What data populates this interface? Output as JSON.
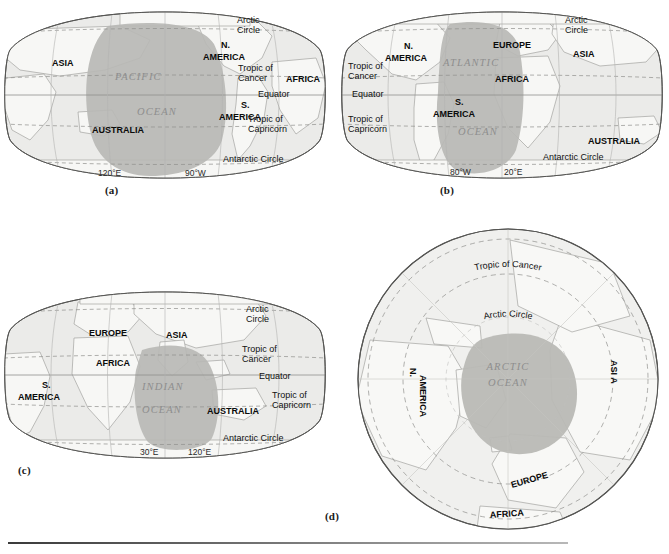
{
  "figure": {
    "panel_count": 4,
    "background_color": "#ffffff",
    "rule_color": "#3a3a3a"
  },
  "colors": {
    "land_fill": "#f2f2f0",
    "land_stroke": "#9a9a96",
    "ocean_fill": "#ebebe9",
    "highlight_ocean_fill": "#b9b9b5",
    "globe_stroke": "#555553",
    "latitude_line": "#8f8f8d",
    "ocean_label": "#8e8e8e",
    "text": "#0b0b0b"
  },
  "panels": [
    {
      "id": "a",
      "caption": "(a)",
      "projection": "robinson",
      "highlighted_ocean": "PACIFIC OCEAN",
      "ocean_label_lines": [
        "PACIFIC",
        "OCEAN"
      ],
      "continents": [
        "ASIA",
        "N. AMERICA",
        "AFRICA",
        "S. AMERICA",
        "AUSTRALIA"
      ],
      "continent_labels": [
        {
          "text": "ASIA",
          "x": 52,
          "y": 66
        },
        {
          "text": "N.",
          "x": 221,
          "y": 48
        },
        {
          "text": "AMERICA",
          "x": 203,
          "y": 60
        },
        {
          "text": "AFRICA",
          "x": 286,
          "y": 82
        },
        {
          "text": "S.",
          "x": 241,
          "y": 108
        },
        {
          "text": "AMERICA",
          "x": 219,
          "y": 120
        },
        {
          "text": "AUSTRALIA",
          "x": 92,
          "y": 133
        }
      ],
      "geoline_labels": [
        {
          "text": "Arctic",
          "x": 237,
          "y": 23
        },
        {
          "text": "Circle",
          "x": 237,
          "y": 33
        },
        {
          "text": "Tropic of",
          "x": 238,
          "y": 71
        },
        {
          "text": "Cancer",
          "x": 238,
          "y": 81
        },
        {
          "text": "Equator",
          "x": 258,
          "y": 97
        },
        {
          "text": "Tropic of",
          "x": 248,
          "y": 122
        },
        {
          "text": "Capricorn",
          "x": 248,
          "y": 132
        },
        {
          "text": "Antarctic Circle",
          "x": 223,
          "y": 162
        }
      ],
      "longitude_labels": [
        {
          "text": "120°E",
          "x": 98,
          "y": 176
        },
        {
          "text": "90°W",
          "x": 185,
          "y": 176
        }
      ]
    },
    {
      "id": "b",
      "caption": "(b)",
      "projection": "robinson",
      "highlighted_ocean": "ATLANTIC OCEAN",
      "ocean_label_lines": [
        "ATLANTIC",
        "OCEAN"
      ],
      "continents": [
        "N. AMERICA",
        "EUROPE",
        "ASIA",
        "AFRICA",
        "S. AMERICA",
        "AUSTRALIA"
      ],
      "continent_labels": [
        {
          "text": "N.",
          "x": 404,
          "y": 49
        },
        {
          "text": "AMERICA",
          "x": 385,
          "y": 61
        },
        {
          "text": "EUROPE",
          "x": 493,
          "y": 48
        },
        {
          "text": "ASIA",
          "x": 573,
          "y": 57
        },
        {
          "text": "AFRICA",
          "x": 495,
          "y": 82
        },
        {
          "text": "S.",
          "x": 455,
          "y": 105
        },
        {
          "text": "AMERICA",
          "x": 433,
          "y": 117
        },
        {
          "text": "AUSTRALIA",
          "x": 588,
          "y": 144
        }
      ],
      "geoline_labels": [
        {
          "text": "Arctic",
          "x": 565,
          "y": 23
        },
        {
          "text": "Circle",
          "x": 565,
          "y": 33
        },
        {
          "text": "Tropic of",
          "x": 348,
          "y": 69
        },
        {
          "text": "Cancer",
          "x": 348,
          "y": 79
        },
        {
          "text": "Equator",
          "x": 352,
          "y": 97
        },
        {
          "text": "Tropic of",
          "x": 348,
          "y": 122
        },
        {
          "text": "Capricorn",
          "x": 348,
          "y": 132
        },
        {
          "text": "Antarctic Circle",
          "x": 543,
          "y": 160
        }
      ],
      "longitude_labels": [
        {
          "text": "80°W",
          "x": 450,
          "y": 175
        },
        {
          "text": "20°E",
          "x": 504,
          "y": 175
        }
      ]
    },
    {
      "id": "c",
      "caption": "(c)",
      "projection": "robinson",
      "highlighted_ocean": "INDIAN OCEAN",
      "ocean_label_lines": [
        "INDIAN",
        "OCEAN"
      ],
      "continents": [
        "EUROPE",
        "ASIA",
        "AFRICA",
        "S. AMERICA",
        "AUSTRALIA"
      ],
      "continent_labels": [
        {
          "text": "EUROPE",
          "x": 89,
          "y": 336
        },
        {
          "text": "ASIA",
          "x": 166,
          "y": 338
        },
        {
          "text": "AFRICA",
          "x": 96,
          "y": 366
        },
        {
          "text": "S.",
          "x": 42,
          "y": 388
        },
        {
          "text": "AMERICA",
          "x": 18,
          "y": 400
        },
        {
          "text": "AUSTRALIA",
          "x": 207,
          "y": 414
        }
      ],
      "geoline_labels": [
        {
          "text": "Arctic",
          "x": 246,
          "y": 312
        },
        {
          "text": "Circle",
          "x": 246,
          "y": 322
        },
        {
          "text": "Tropic of",
          "x": 242,
          "y": 352
        },
        {
          "text": "Cancer",
          "x": 242,
          "y": 362
        },
        {
          "text": "Equator",
          "x": 259,
          "y": 379
        },
        {
          "text": "Tropic of",
          "x": 272,
          "y": 398
        },
        {
          "text": "Capricorn",
          "x": 272,
          "y": 408
        },
        {
          "text": "Antarctic Circle",
          "x": 223,
          "y": 441
        }
      ],
      "longitude_labels": [
        {
          "text": "30°E",
          "x": 140,
          "y": 455
        },
        {
          "text": "120°E",
          "x": 188,
          "y": 455
        }
      ]
    },
    {
      "id": "d",
      "caption": "(d)",
      "projection": "polar-azimuthal",
      "highlighted_ocean": "ARCTIC OCEAN",
      "ocean_label_lines": [
        "ARCTIC",
        "OCEAN"
      ],
      "continents": [
        "N. AMERICA",
        "ASI A",
        "EUROPE",
        "AFRICA"
      ],
      "continent_labels": [
        {
          "text": "N.",
          "rotated": true
        },
        {
          "text": "AMERICA",
          "rotated": true
        },
        {
          "text": "ASI A",
          "rotated": true
        },
        {
          "text": "EUROPE",
          "rotated": true
        },
        {
          "text": "AFRICA",
          "rotated": false
        }
      ],
      "geoline_labels": [
        {
          "text": "Tropic of Cancer",
          "curved": true
        },
        {
          "text": "Arctic Circle",
          "curved": true
        }
      ],
      "longitude_labels": []
    }
  ]
}
